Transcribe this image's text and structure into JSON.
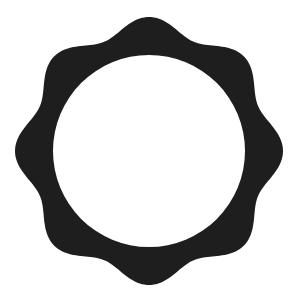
{
  "shape": {
    "type": "wavy-ring",
    "lobes": 8,
    "fill": "#1e1e1e",
    "background": "#ffffff",
    "center": [
      149,
      151
    ],
    "outer_radius_mean": 126,
    "outer_wave_amplitude": 8,
    "inner_radius": 96
  }
}
